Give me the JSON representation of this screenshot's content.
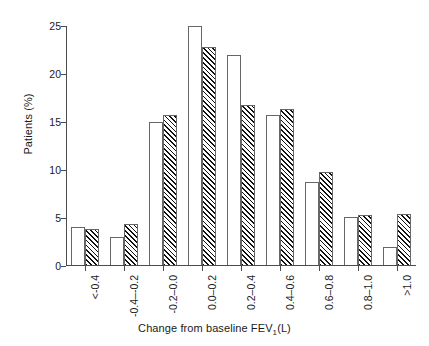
{
  "chart_data": {
    "type": "bar",
    "title": "",
    "xlabel": "Change from baseline  FEV1(L)",
    "ylabel": "Patients (%)",
    "ylim": [
      0,
      25
    ],
    "yticks": [
      0,
      5,
      10,
      15,
      20,
      25
    ],
    "grid": false,
    "legend": "none",
    "categories": [
      "<-0.4",
      "-0.4–-0.2",
      "-0.2–0.0",
      "0.0–0.2",
      "0.2–0.4",
      "0.4–0.6",
      "0.6–0.8",
      "0.8–1.0",
      ">1.0"
    ],
    "series": [
      {
        "name": "open",
        "fill": "open",
        "values": [
          4.1,
          3.0,
          15.0,
          25.0,
          22.0,
          15.7,
          8.8,
          5.1,
          2.0
        ]
      },
      {
        "name": "hatched",
        "fill": "diagonal-hatch",
        "values": [
          3.9,
          4.4,
          15.7,
          22.8,
          16.8,
          16.4,
          9.8,
          5.3,
          5.4
        ]
      }
    ]
  },
  "axes": {
    "y_title": "Patients (%)",
    "y_tick_labels": [
      "0",
      "5",
      "10",
      "15",
      "20",
      "25"
    ],
    "x_title_part1": "Change from baseline  FEV",
    "x_title_sub": "1",
    "x_title_part2": "(L)",
    "x_tick_labels": [
      "<-0.4",
      "-0.4–-0.2",
      "-0.2–0.0",
      "0.0–0.2",
      "0.2–0.4",
      "0.4–0.6",
      "0.6–0.8",
      "0.8–1.0",
      ">1.0"
    ]
  },
  "colors": {
    "axis": "#4c4c4c",
    "bar_edge": "#666666",
    "bar_open_fill": "#ffffff",
    "hatch_line": "#111111",
    "background": "#ffffff"
  }
}
